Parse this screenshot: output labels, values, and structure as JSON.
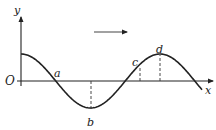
{
  "figure": {
    "type": "wave-diagram",
    "axis_labels": {
      "x": "x",
      "y": "y",
      "origin": "O"
    },
    "points": [
      {
        "label": "a",
        "position": "zero crossing, descending"
      },
      {
        "label": "b",
        "position": "trough"
      },
      {
        "label": "c",
        "position": "rising slope above axis"
      },
      {
        "label": "d",
        "position": "crest"
      }
    ],
    "propagation_direction": "right",
    "colors": {
      "stroke": "#222222",
      "background": "#ffffff"
    }
  }
}
